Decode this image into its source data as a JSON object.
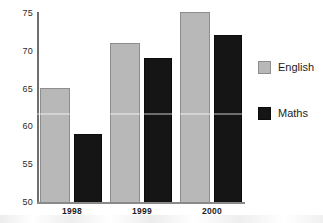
{
  "chart_data": {
    "type": "bar",
    "title": "",
    "subtitle": "",
    "xlabel": "",
    "ylabel": "",
    "categories": [
      "1998",
      "1999",
      "2000"
    ],
    "series": [
      {
        "name": "English",
        "values": [
          65,
          71,
          75
        ],
        "color": "#b8b8b8"
      },
      {
        "name": "Maths",
        "values": [
          59,
          69,
          72
        ],
        "color": "#151515"
      }
    ],
    "ylim": [
      50,
      75
    ],
    "yticks": [
      50,
      55,
      60,
      65,
      70,
      75
    ],
    "ytick_labels": [
      "50",
      "55",
      "60",
      "65",
      "70",
      "75"
    ],
    "grid": false,
    "legend_position": "right",
    "annotations": []
  },
  "axes": {
    "y_tick_labels": [
      "75",
      "70",
      "65",
      "60",
      "55",
      "50"
    ],
    "x_tick_labels": [
      "1998",
      "1999",
      "2000"
    ]
  },
  "legend": {
    "items": [
      {
        "label": "English",
        "color": "#b8b8b8"
      },
      {
        "label": "Maths",
        "color": "#151515"
      }
    ]
  }
}
